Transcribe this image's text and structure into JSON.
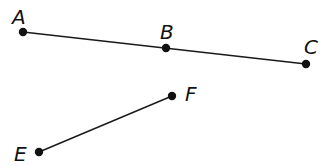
{
  "diagram": {
    "type": "geometry-line-segments",
    "points": [
      {
        "label": "A",
        "x": 23,
        "y": 32,
        "label_x": 12,
        "label_y": 24
      },
      {
        "label": "B",
        "x": 166,
        "y": 48,
        "label_x": 160,
        "label_y": 39
      },
      {
        "label": "C",
        "x": 306,
        "y": 64,
        "label_x": 304,
        "label_y": 54
      },
      {
        "label": "F",
        "x": 172,
        "y": 96,
        "label_x": 185,
        "label_y": 101
      },
      {
        "label": "E",
        "x": 39,
        "y": 152,
        "label_x": 14,
        "label_y": 161
      }
    ],
    "segments": [
      {
        "from": "A",
        "to": "C",
        "through": "B"
      },
      {
        "from": "E",
        "to": "F"
      }
    ],
    "colors": {
      "stroke": "#1a1a1a",
      "point": "#111111",
      "background": "#ffffff"
    }
  }
}
